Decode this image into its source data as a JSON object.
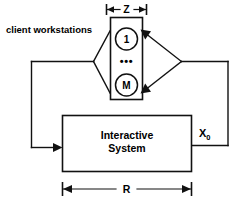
{
  "diagram": {
    "caption_label": "client workstations",
    "top_dimension": {
      "name": "Z",
      "label": "Z"
    },
    "bottom_dimension": {
      "name": "R",
      "label": "R"
    },
    "workstation_group": {
      "nodes": [
        {
          "id": "first",
          "label": "1"
        },
        {
          "id": "ellipsis",
          "label": "•••"
        },
        {
          "id": "last",
          "label": "M"
        }
      ]
    },
    "system_box": {
      "line1": "Interactive",
      "line2": "System"
    },
    "feedback_label": {
      "base": "X",
      "subscript": "0"
    },
    "colors": {
      "stroke": "#111111",
      "background": "#ffffff",
      "text": "#000000"
    }
  }
}
